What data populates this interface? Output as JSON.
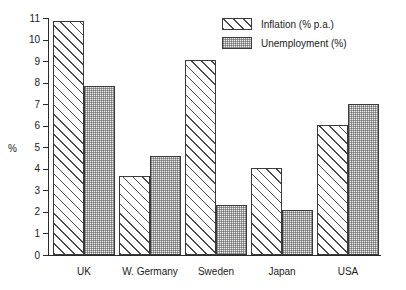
{
  "chart_data": {
    "type": "bar",
    "title": "",
    "subtitle": "",
    "xlabel": "",
    "ylabel": "%",
    "ylim": [
      0,
      11
    ],
    "ytick_step": 1,
    "yticks": [
      "11",
      "10",
      "9",
      "8",
      "7",
      "6",
      "5",
      "4",
      "3",
      "2",
      "1",
      "0"
    ],
    "grid": false,
    "legend_position": "top-right",
    "categories": [
      "UK",
      "W. Germany",
      "Sweden",
      "Japan",
      "USA"
    ],
    "series": [
      {
        "name": "Inflation (% p.a.)",
        "fill": "diagonal-hatch",
        "values": [
          10.85,
          3.65,
          9.05,
          4.05,
          6.05
        ]
      },
      {
        "name": "Unemployment (%)",
        "fill": "stipple-dots",
        "values": [
          7.85,
          4.6,
          2.3,
          2.1,
          7.0
        ]
      }
    ]
  },
  "legend": {
    "items": [
      {
        "label": "Inflation (% p.a.)",
        "swatch": "hatch-swatch"
      },
      {
        "label": "Unemployment (%)",
        "swatch": "stipple-swatch"
      }
    ]
  },
  "colors": {
    "axis": "#2a2a2a",
    "bar_outline": "#3a3a3a",
    "hatch_line": "#4a4a4a",
    "stipple_fill": "#eeeeee",
    "background": "#ffffff",
    "text": "#1a1a1a"
  }
}
